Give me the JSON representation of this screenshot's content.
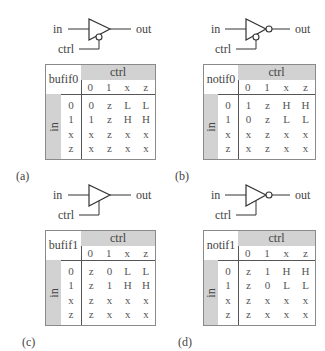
{
  "colors": {
    "band": "#d2d2d2",
    "line": "#333333",
    "border": "#8a8a8a"
  },
  "panels": [
    {
      "id": "a",
      "caption": "(a)",
      "gate": {
        "type": "bufif0",
        "inverted_output": false,
        "active_low_ctrl": true,
        "in_label": "in",
        "out_label": "out",
        "ctrl_label": "ctrl"
      },
      "table": {
        "name": "bufif0",
        "ctrl_header": "ctrl",
        "in_header": "in",
        "ctrl_values": [
          "0",
          "1",
          "x",
          "z"
        ],
        "in_values": [
          "0",
          "1",
          "x",
          "z"
        ],
        "rows": [
          [
            "0",
            "z",
            "L",
            "L"
          ],
          [
            "1",
            "z",
            "H",
            "H"
          ],
          [
            "x",
            "z",
            "x",
            "x"
          ],
          [
            "x",
            "z",
            "x",
            "x"
          ]
        ]
      }
    },
    {
      "id": "b",
      "caption": "(b)",
      "gate": {
        "type": "notif0",
        "inverted_output": true,
        "active_low_ctrl": true,
        "in_label": "in",
        "out_label": "out",
        "ctrl_label": "ctrl"
      },
      "table": {
        "name": "notif0",
        "ctrl_header": "ctrl",
        "in_header": "in",
        "ctrl_values": [
          "0",
          "1",
          "x",
          "z"
        ],
        "in_values": [
          "0",
          "1",
          "x",
          "z"
        ],
        "rows": [
          [
            "1",
            "z",
            "H",
            "H"
          ],
          [
            "0",
            "z",
            "L",
            "L"
          ],
          [
            "x",
            "z",
            "x",
            "x"
          ],
          [
            "x",
            "z",
            "x",
            "x"
          ]
        ]
      }
    },
    {
      "id": "c",
      "caption": "(c)",
      "gate": {
        "type": "bufif1",
        "inverted_output": false,
        "active_low_ctrl": false,
        "in_label": "in",
        "out_label": "out",
        "ctrl_label": "ctrl"
      },
      "table": {
        "name": "bufif1",
        "ctrl_header": "ctrl",
        "in_header": "in",
        "ctrl_values": [
          "0",
          "1",
          "x",
          "z"
        ],
        "in_values": [
          "0",
          "1",
          "x",
          "z"
        ],
        "rows": [
          [
            "z",
            "0",
            "L",
            "L"
          ],
          [
            "z",
            "1",
            "H",
            "H"
          ],
          [
            "z",
            "x",
            "x",
            "x"
          ],
          [
            "z",
            "x",
            "x",
            "x"
          ]
        ]
      }
    },
    {
      "id": "d",
      "caption": "(d)",
      "gate": {
        "type": "notif1",
        "inverted_output": true,
        "active_low_ctrl": false,
        "in_label": "in",
        "out_label": "out",
        "ctrl_label": "ctrl"
      },
      "table": {
        "name": "notif1",
        "ctrl_header": "ctrl",
        "in_header": "in",
        "ctrl_values": [
          "0",
          "1",
          "x",
          "z"
        ],
        "in_values": [
          "0",
          "1",
          "x",
          "z"
        ],
        "rows": [
          [
            "z",
            "1",
            "H",
            "H"
          ],
          [
            "z",
            "0",
            "L",
            "L"
          ],
          [
            "z",
            "x",
            "x",
            "x"
          ],
          [
            "z",
            "x",
            "x",
            "x"
          ]
        ]
      }
    }
  ]
}
